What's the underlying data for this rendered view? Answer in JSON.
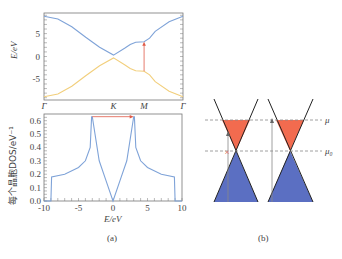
{
  "chart_data": [
    {
      "type": "line",
      "title": "",
      "panel": "a-top",
      "xlabel": "",
      "ylabel": "E/eV",
      "xticks": [
        "Γ",
        "K",
        "M",
        "Γ"
      ],
      "yticks": [
        "5",
        "0",
        "-5"
      ],
      "ylim": [
        -9.5,
        9.5
      ],
      "series": [
        {
          "name": "upper band",
          "color": "#7fa3d8",
          "x": [
            0,
            0.1,
            0.2,
            0.3,
            0.4,
            0.5,
            0.58,
            0.62,
            0.66,
            0.72,
            0.76,
            0.8,
            0.9,
            1.0
          ],
          "y": [
            8.8,
            8.2,
            6.5,
            4.2,
            2.0,
            0.3,
            1.8,
            2.6,
            3.1,
            3.2,
            4.0,
            5.5,
            7.6,
            8.8
          ]
        },
        {
          "name": "lower band",
          "color": "#f2cf7c",
          "x": [
            0,
            0.1,
            0.2,
            0.3,
            0.4,
            0.5,
            0.58,
            0.62,
            0.66,
            0.72,
            0.76,
            0.8,
            0.9,
            1.0
          ],
          "y": [
            -8.8,
            -8.2,
            -6.5,
            -4.2,
            -2.0,
            -0.3,
            -1.8,
            -2.6,
            -3.1,
            -3.2,
            -4.0,
            -5.5,
            -7.6,
            -8.8
          ]
        }
      ],
      "xtick_positions": [
        0,
        0.5,
        0.72,
        1.0
      ],
      "annotations": [
        {
          "type": "arrow",
          "color": "#e05a47",
          "x": 0.72,
          "from": -3.2,
          "to": 3.2
        }
      ]
    },
    {
      "type": "line",
      "panel": "a-bottom",
      "xlabel": "E/eV",
      "ylabel": "每个晶胞DOS/eV⁻¹",
      "xticks": [
        "-10",
        "-5",
        "0",
        "5",
        "10"
      ],
      "yticks": [
        "0.0",
        "0.1",
        "0.2",
        "0.3",
        "0.4",
        "0.5",
        "0.6"
      ],
      "xlim": [
        -10,
        10
      ],
      "ylim": [
        0,
        0.65
      ],
      "series": [
        {
          "name": "DOS",
          "color": "#7fa3d8",
          "x": [
            -10,
            -9.0,
            -8.9,
            -7,
            -5,
            -4,
            -3.3,
            -3.1,
            -3.0,
            -2,
            -1,
            0,
            1,
            2,
            3.0,
            3.1,
            3.3,
            4,
            5,
            7,
            8.9,
            9.0,
            10
          ],
          "y": [
            0,
            0,
            0.18,
            0.2,
            0.25,
            0.3,
            0.4,
            0.63,
            0.63,
            0.3,
            0.15,
            0.0,
            0.15,
            0.3,
            0.63,
            0.63,
            0.4,
            0.3,
            0.25,
            0.2,
            0.18,
            0,
            0
          ]
        }
      ],
      "annotations": [
        {
          "type": "arrow",
          "color": "#e05a47",
          "y": 0.63,
          "from": -3,
          "to": 3
        }
      ]
    },
    {
      "type": "diagram",
      "panel": "b",
      "labels": {
        "mu": "μ",
        "mu0": "μ₀"
      },
      "colors": {
        "filled_upper": "#f26b4f",
        "filled_lower": "#5b6fc2",
        "dash": "#888888",
        "cross": "#e05a47"
      }
    }
  ],
  "captions": {
    "a": "(a)",
    "b": "(b)"
  }
}
